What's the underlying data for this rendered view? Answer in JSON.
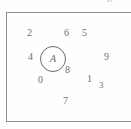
{
  "figure": {
    "frame": {
      "border_color": "#8d8d8d",
      "clipped_right_edge": true
    },
    "top_cut_glyph": {
      "text": "b",
      "color": "#b9b9b9",
      "note": "partially cropped italic character above frame, top-right"
    },
    "circled_node": {
      "label": "A",
      "style": "italic",
      "circle_color": "#6a6a6a"
    },
    "digits": [
      {
        "id": "digit-2",
        "value": "2",
        "x": 27,
        "y": 28,
        "size": 10
      },
      {
        "id": "digit-6",
        "value": "6",
        "x": 64,
        "y": 28,
        "size": 10
      },
      {
        "id": "digit-5",
        "value": "5",
        "x": 82,
        "y": 28,
        "size": 10
      },
      {
        "id": "digit-4",
        "value": "4",
        "x": 28,
        "y": 52,
        "size": 10
      },
      {
        "id": "digit-9",
        "value": "9",
        "x": 104,
        "y": 52,
        "size": 10
      },
      {
        "id": "digit-8",
        "value": "8",
        "x": 65,
        "y": 65,
        "size": 10
      },
      {
        "id": "digit-0",
        "value": "0",
        "x": 38,
        "y": 75,
        "size": 10
      },
      {
        "id": "digit-1",
        "value": "1",
        "x": 87,
        "y": 74,
        "size": 10
      },
      {
        "id": "digit-3",
        "value": "3",
        "x": 99,
        "y": 81,
        "size": 9
      },
      {
        "id": "digit-7",
        "value": "7",
        "x": 63,
        "y": 96,
        "size": 10
      }
    ]
  }
}
